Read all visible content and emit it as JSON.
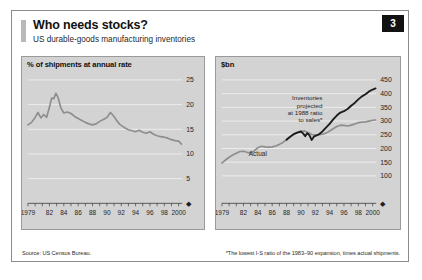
{
  "header": {
    "title": "Who needs stocks?",
    "subtitle": "US durable-goods manufacturing inventories",
    "badge": "3"
  },
  "notes": {
    "source": "Source: US Census Bureau.",
    "footnote": "*The lowest I-S ratio of the 1983–90 expansion, times actual shipments."
  },
  "colors": {
    "panel_background": "#d3d3d3",
    "frame": "#8c8c8c",
    "grid": "#efefef",
    "series_light": "#8e8e8e",
    "series_dark": "#1c1c1c",
    "badge_background": "#121212"
  },
  "panels": {
    "left": {
      "title": "% of shipments at annual rate"
    },
    "right": {
      "title": "$bn"
    }
  },
  "chart_data": [
    {
      "type": "line",
      "id": "inventory-sales-ratio",
      "title": "% of shipments at annual rate",
      "xlabel": "",
      "ylabel": "% of shipments at annual rate",
      "xlim": [
        1979,
        2000.5
      ],
      "ylim": [
        0,
        25
      ],
      "yticks": [
        5,
        10,
        15,
        20,
        25
      ],
      "ytick_labels": [
        "5",
        "10",
        "15",
        "20",
        "25"
      ],
      "xticks": [
        1979,
        1982,
        1984,
        1986,
        1988,
        1990,
        1992,
        1994,
        1996,
        1998,
        2000
      ],
      "xtick_labels": [
        "1979",
        "82",
        "84",
        "86",
        "88",
        "90",
        "92",
        "94",
        "96",
        "98",
        "2000"
      ],
      "minor_tick_interval": 1,
      "grid": true,
      "legend": "none",
      "series": [
        {
          "name": "Inventories as % of shipments at annual rate",
          "color": "#8e8e8e",
          "x": [
            1979.0,
            1979.5,
            1980.0,
            1980.4,
            1980.8,
            1981.2,
            1981.6,
            1982.0,
            1982.3,
            1982.6,
            1982.9,
            1983.2,
            1983.6,
            1984.0,
            1984.5,
            1985.0,
            1985.5,
            1986.0,
            1986.5,
            1987.0,
            1987.5,
            1988.0,
            1988.5,
            1989.0,
            1989.5,
            1990.0,
            1990.5,
            1991.0,
            1991.4,
            1991.8,
            1992.2,
            1992.6,
            1993.0,
            1993.5,
            1994.0,
            1994.5,
            1995.0,
            1995.5,
            1996.0,
            1996.5,
            1997.0,
            1997.5,
            1998.0,
            1998.5,
            1999.0,
            1999.5,
            2000.0,
            2000.4
          ],
          "y": [
            15.9,
            16.4,
            17.4,
            18.4,
            17.3,
            18.0,
            17.4,
            19.5,
            21.3,
            21.2,
            22.3,
            21.4,
            19.3,
            18.3,
            18.5,
            18.2,
            17.6,
            17.2,
            16.8,
            16.4,
            16.1,
            15.9,
            16.1,
            16.6,
            17.0,
            17.4,
            18.4,
            17.6,
            16.7,
            16.0,
            15.6,
            15.2,
            14.9,
            14.7,
            14.5,
            14.8,
            14.4,
            14.2,
            14.5,
            14.0,
            13.7,
            13.5,
            13.4,
            13.2,
            12.9,
            12.7,
            12.6,
            12.0
          ]
        }
      ]
    },
    {
      "type": "line",
      "id": "inventories-actual-vs-projected",
      "title": "$bn",
      "xlabel": "",
      "ylabel": "$bn",
      "xlim": [
        1979,
        2000.5
      ],
      "ylim": [
        0,
        450
      ],
      "yticks": [
        100,
        150,
        200,
        250,
        300,
        350,
        400,
        450
      ],
      "ytick_labels": [
        "100",
        "150",
        "200",
        "250",
        "300",
        "350",
        "400",
        "450"
      ],
      "xticks": [
        1979,
        1982,
        1984,
        1986,
        1988,
        1990,
        1992,
        1994,
        1996,
        1998,
        2000
      ],
      "xtick_labels": [
        "1979",
        "82",
        "84",
        "86",
        "88",
        "90",
        "92",
        "94",
        "96",
        "98",
        "2000"
      ],
      "minor_tick_interval": 1,
      "grid": true,
      "legend": "inline-labels",
      "annotations": [
        {
          "text_lines": [
            "Inventories",
            "projected",
            "at 1988 ratio",
            "to sales*"
          ],
          "x": 1993.0,
          "y": 375
        },
        {
          "text_lines": [
            "Actual"
          ],
          "x": 1984.0,
          "y": 172
        }
      ],
      "series": [
        {
          "name": "Actual",
          "color": "#8e8e8e",
          "x": [
            1979.0,
            1979.5,
            1980.0,
            1980.5,
            1981.0,
            1981.5,
            1982.0,
            1982.5,
            1983.0,
            1983.5,
            1984.0,
            1984.5,
            1985.0,
            1985.5,
            1986.0,
            1986.5,
            1987.0,
            1987.5,
            1988.0,
            1988.5,
            1989.0,
            1989.5,
            1990.0,
            1990.5,
            1991.0,
            1991.5,
            1992.0,
            1992.5,
            1993.0,
            1993.5,
            1994.0,
            1994.5,
            1995.0,
            1995.5,
            1996.0,
            1996.5,
            1997.0,
            1997.5,
            1998.0,
            1998.5,
            1999.0,
            1999.5,
            2000.0,
            2000.4
          ],
          "y": [
            147,
            158,
            168,
            176,
            183,
            189,
            190,
            186,
            184,
            191,
            203,
            208,
            206,
            205,
            206,
            209,
            215,
            222,
            232,
            243,
            252,
            258,
            262,
            264,
            258,
            251,
            249,
            250,
            252,
            256,
            264,
            272,
            280,
            285,
            284,
            282,
            285,
            289,
            294,
            296,
            297,
            300,
            303,
            304
          ]
        },
        {
          "name": "Inventories projected at 1988 ratio to sales",
          "color": "#1c1c1c",
          "x": [
            1988.0,
            1988.5,
            1989.0,
            1989.5,
            1990.0,
            1990.3,
            1990.6,
            1990.9,
            1991.2,
            1991.5,
            1991.8,
            1992.1,
            1992.4,
            1992.7,
            1993.0,
            1993.5,
            1994.0,
            1994.5,
            1995.0,
            1995.5,
            1996.0,
            1996.5,
            1997.0,
            1997.5,
            1998.0,
            1998.5,
            1999.0,
            1999.5,
            2000.0,
            2000.4
          ],
          "y": [
            232,
            243,
            252,
            258,
            262,
            255,
            245,
            256,
            248,
            231,
            243,
            247,
            250,
            255,
            262,
            276,
            290,
            306,
            320,
            331,
            336,
            344,
            356,
            366,
            379,
            390,
            398,
            408,
            415,
            419
          ]
        }
      ]
    }
  ]
}
